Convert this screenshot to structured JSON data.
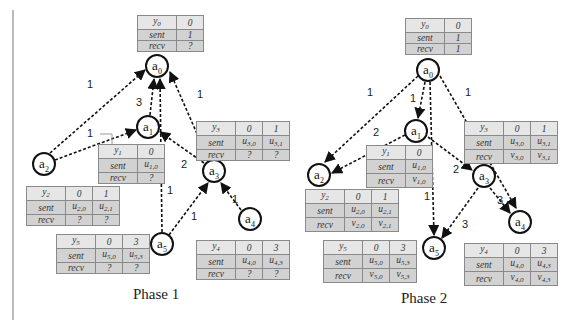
{
  "phases": [
    {
      "caption": "Phase 1",
      "nodes": [
        {
          "id": "a0",
          "base": "a",
          "index": "0"
        },
        {
          "id": "a1",
          "base": "a",
          "index": "1"
        },
        {
          "id": "a2",
          "base": "a",
          "index": "2"
        },
        {
          "id": "a3",
          "base": "a",
          "index": "3"
        },
        {
          "id": "a4",
          "base": "a",
          "index": "4"
        },
        {
          "id": "a5",
          "base": "a",
          "index": "5"
        }
      ],
      "edges": [
        {
          "from": "a2",
          "to": "a0",
          "label": "1"
        },
        {
          "from": "a2",
          "to": "a1",
          "label": "1"
        },
        {
          "from": "a1",
          "to": "a0",
          "label": "3"
        },
        {
          "from": "a3",
          "to": "a0",
          "label": "1"
        },
        {
          "from": "a5",
          "to": "a0",
          "label": "1"
        },
        {
          "from": "a3",
          "to": "a1",
          "label": "2"
        },
        {
          "from": "a5",
          "to": "a3",
          "label": "1"
        },
        {
          "from": "a4",
          "to": "a3",
          "label": "1"
        }
      ],
      "tables": {
        "y0": {
          "header": [
            "y0",
            "0"
          ],
          "sent": [
            "sent",
            "1"
          ],
          "recv": [
            "recv",
            "?"
          ]
        },
        "y1": {
          "header": [
            "y1",
            "0"
          ],
          "sent": [
            "sent",
            "u1,0"
          ],
          "recv": [
            "recv",
            "?"
          ]
        },
        "y2": {
          "header": [
            "y2",
            "0",
            "1"
          ],
          "sent": [
            "sent",
            "u2,0",
            "u2,1"
          ],
          "recv": [
            "recv",
            "?",
            "?"
          ]
        },
        "y3": {
          "header": [
            "y3",
            "0",
            "1"
          ],
          "sent": [
            "sent",
            "u3,0",
            "u3,1"
          ],
          "recv": [
            "recv",
            "?",
            "?"
          ]
        },
        "y4": {
          "header": [
            "y4",
            "0",
            "3"
          ],
          "sent": [
            "sent",
            "u4,0",
            "u4,3"
          ],
          "recv": [
            "recv",
            "?",
            "?"
          ]
        },
        "y5": {
          "header": [
            "y5",
            "0",
            "3"
          ],
          "sent": [
            "sent",
            "u5,0",
            "u5,3"
          ],
          "recv": [
            "recv",
            "?",
            "?"
          ]
        }
      }
    },
    {
      "caption": "Phase 2",
      "nodes": [
        {
          "id": "a0",
          "base": "a",
          "index": "0"
        },
        {
          "id": "a1",
          "base": "a",
          "index": "1"
        },
        {
          "id": "a2",
          "base": "a",
          "index": "2"
        },
        {
          "id": "a3",
          "base": "a",
          "index": "3"
        },
        {
          "id": "a4",
          "base": "a",
          "index": "4"
        },
        {
          "id": "a5",
          "base": "a",
          "index": "5"
        }
      ],
      "edges": [
        {
          "from": "a0",
          "to": "a2",
          "label": "1"
        },
        {
          "from": "a0",
          "to": "a1",
          "label": "1"
        },
        {
          "from": "a0",
          "to": "a5",
          "label": "1"
        },
        {
          "from": "a0",
          "to": "a4",
          "label": "1"
        },
        {
          "from": "a1",
          "to": "a2",
          "label": "2"
        },
        {
          "from": "a1",
          "to": "a3",
          "label": "2"
        },
        {
          "from": "a3",
          "to": "a4",
          "label": "3"
        },
        {
          "from": "a3",
          "to": "a5",
          "label": "3"
        }
      ],
      "tables": {
        "y0": {
          "header": [
            "y0",
            "0"
          ],
          "sent": [
            "sent",
            "1"
          ],
          "recv": [
            "recv",
            "1"
          ]
        },
        "y1": {
          "header": [
            "y1",
            "0"
          ],
          "sent": [
            "sent",
            "u1,0"
          ],
          "recv": [
            "recv",
            "v1,0"
          ]
        },
        "y2": {
          "header": [
            "y2",
            "0",
            "1"
          ],
          "sent": [
            "sent",
            "u2,0",
            "u2,1"
          ],
          "recv": [
            "recv",
            "v2,0",
            "v2,1"
          ]
        },
        "y3": {
          "header": [
            "y3",
            "0",
            "1"
          ],
          "sent": [
            "sent",
            "u3,0",
            "u3,1"
          ],
          "recv": [
            "recv",
            "v3,0",
            "v3,1"
          ]
        },
        "y4": {
          "header": [
            "y4",
            "0",
            "3"
          ],
          "sent": [
            "sent",
            "u4,0",
            "u4,3"
          ],
          "recv": [
            "recv",
            "v4,0",
            "v4,3"
          ]
        },
        "y5": {
          "header": [
            "y5",
            "0",
            "3"
          ],
          "sent": [
            "sent",
            "u5,0",
            "u5,3"
          ],
          "recv": [
            "recv",
            "v5,0",
            "v5,3"
          ]
        }
      }
    }
  ],
  "colors": {
    "edge": "#111111",
    "table_header_bg": "#e6e6e6",
    "table_body_bg": "#d2d2d2",
    "table_border": "#8a8a8a"
  }
}
